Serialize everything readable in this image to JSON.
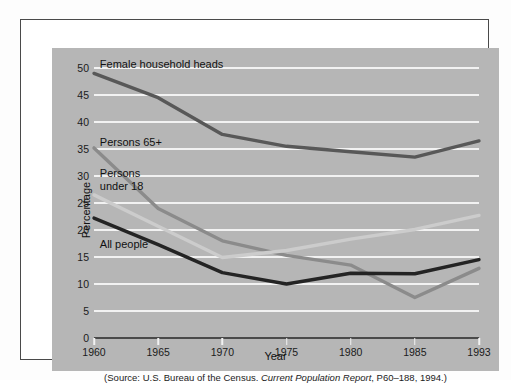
{
  "chart_data": {
    "type": "line",
    "title": "",
    "xlabel": "Year",
    "ylabel": "Percentage",
    "x": [
      1960,
      1965,
      1970,
      1975,
      1980,
      1985,
      1993
    ],
    "categories": [
      "1960",
      "1965",
      "1970",
      "1975",
      "1980",
      "1985",
      "1993"
    ],
    "xlim": [
      1960,
      1993
    ],
    "ylim": [
      0,
      50
    ],
    "yticks": [
      0,
      5,
      10,
      15,
      20,
      25,
      30,
      35,
      40,
      45,
      50
    ],
    "grid": true,
    "legend_position": "inline-annotations",
    "series": [
      {
        "name": "Female household heads",
        "color": "#585858",
        "values": [
          49.0,
          44.5,
          37.7,
          35.5,
          34.5,
          33.5,
          36.5
        ]
      },
      {
        "name": "Persons 65+",
        "color": "#8b8b8b",
        "values": [
          35.2,
          24.0,
          18.0,
          15.3,
          13.5,
          7.5,
          12.9
        ]
      },
      {
        "name": "Persons under 18",
        "color": "#cccccc",
        "values": [
          26.5,
          20.7,
          14.9,
          16.2,
          18.3,
          20.1,
          22.7
        ]
      },
      {
        "name": "All people",
        "color": "#242424",
        "values": [
          22.2,
          17.3,
          12.1,
          10.0,
          12.0,
          11.9,
          14.5
        ]
      }
    ],
    "annotations": [
      {
        "text": "Female household heads",
        "x": 1960.5,
        "y": 51.8
      },
      {
        "text": "Persons 65+",
        "x": 1960.5,
        "y": 37.4
      },
      {
        "text": "Persons\nunder 18",
        "x": 1960.5,
        "y": 31.6
      },
      {
        "text": "All people",
        "x": 1960.5,
        "y": 18.6
      }
    ],
    "source_note": {
      "prefix": "(Source: U.S. Bureau of the Census. ",
      "italic": "Current Population Report",
      "suffix": ", P60–188, 1994.)"
    }
  },
  "figure": {
    "panel_color": "#b6b6b6",
    "gridline_color": "#f2f2f2",
    "axis_color": "#4a4a4a",
    "border_color": "#4a4a4a",
    "page_color": "#ffffff"
  }
}
